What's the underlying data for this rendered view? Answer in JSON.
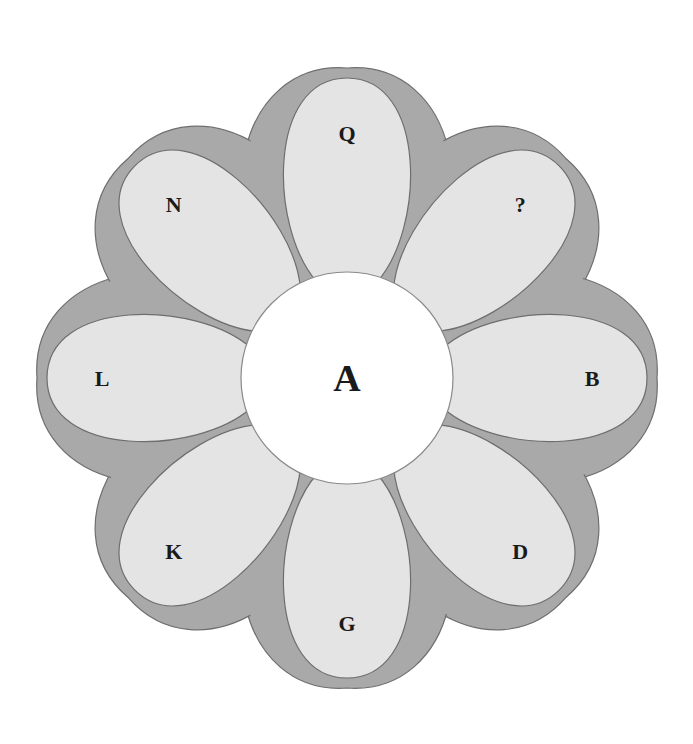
{
  "diagram": {
    "type": "letter-flower-puzzle",
    "center": {
      "label": "A"
    },
    "petals": [
      {
        "position": "top",
        "angle": -90,
        "label": "Q"
      },
      {
        "position": "top-right",
        "angle": -45,
        "label": "?"
      },
      {
        "position": "right",
        "angle": 0,
        "label": "B"
      },
      {
        "position": "bottom-right",
        "angle": 45,
        "label": "D"
      },
      {
        "position": "bottom",
        "angle": 90,
        "label": "G"
      },
      {
        "position": "bottom-left",
        "angle": 135,
        "label": "K"
      },
      {
        "position": "left",
        "angle": 180,
        "label": "L"
      },
      {
        "position": "top-left",
        "angle": -135,
        "label": "N"
      }
    ],
    "colors": {
      "outer_ring": "#a9a9a9",
      "petal_fill": "#e4e4e4",
      "center_fill": "#ffffff",
      "outline": "#6e6e6e",
      "text": "#1a1a1a"
    }
  }
}
